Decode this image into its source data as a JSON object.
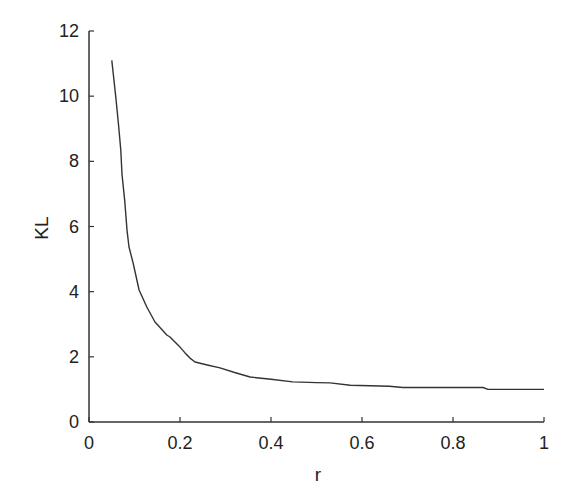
{
  "chart_data": {
    "type": "line",
    "title": "",
    "xlabel": "r",
    "ylabel": "KL",
    "xlim": [
      0,
      1
    ],
    "ylim": [
      0,
      12
    ],
    "xticks": [
      0,
      0.2,
      0.4,
      0.6,
      0.8,
      1
    ],
    "xtick_labels": [
      "0",
      "0.2",
      "0.4",
      "0.6",
      "0.8",
      "1"
    ],
    "yticks": [
      0,
      2,
      4,
      6,
      8,
      10,
      12
    ],
    "ytick_labels": [
      "0",
      "2",
      "4",
      "6",
      "8",
      "10",
      "12"
    ],
    "grid": false,
    "legend": null,
    "series": [
      {
        "name": "KL",
        "color": "#333333",
        "x": [
          0.05,
          0.059,
          0.065,
          0.07,
          0.0725,
          0.0785,
          0.0835,
          0.088,
          0.097,
          0.11,
          0.127,
          0.145,
          0.171,
          0.178,
          0.2,
          0.211,
          0.222,
          0.233,
          0.26,
          0.288,
          0.32,
          0.354,
          0.4,
          0.448,
          0.5,
          0.53,
          0.574,
          0.618,
          0.66,
          0.69,
          0.75,
          0.8,
          0.866,
          0.877,
          0.93,
          1.0
        ],
        "y": [
          11.1,
          9.97,
          9.1,
          8.34,
          7.6,
          6.8,
          5.89,
          5.37,
          4.88,
          4.05,
          3.53,
          3.07,
          2.67,
          2.61,
          2.3,
          2.12,
          1.96,
          1.84,
          1.75,
          1.66,
          1.52,
          1.38,
          1.31,
          1.23,
          1.21,
          1.2,
          1.13,
          1.11,
          1.1,
          1.06,
          1.06,
          1.06,
          1.06,
          1.0,
          1.0,
          1.0
        ]
      }
    ]
  },
  "axes": {
    "x_label": "r",
    "y_label": "KL"
  }
}
